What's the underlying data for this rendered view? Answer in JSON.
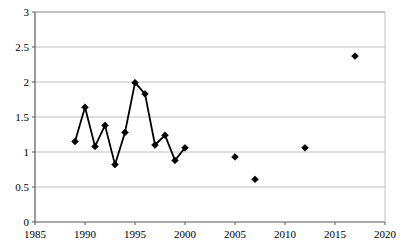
{
  "chart_data": {
    "type": "line",
    "title": "",
    "subtitle": "",
    "xlabel": "",
    "ylabel": "",
    "xlim": [
      1985,
      2020
    ],
    "ylim": [
      0,
      3
    ],
    "xticks": [
      1985,
      1990,
      1995,
      2000,
      2005,
      2010,
      2015,
      2020
    ],
    "xtick_labels": [
      "1985",
      "1990",
      "1995",
      "2000",
      "2005",
      "2010",
      "2015",
      "2020"
    ],
    "yticks": [
      0,
      0.5,
      1,
      1.5,
      2,
      2.5,
      3
    ],
    "ytick_labels": [
      "0",
      "0.5",
      "1",
      "1.5",
      "2",
      "2.5",
      "3"
    ],
    "grid": "horizontal",
    "legend": "none",
    "marker": "diamond",
    "marker_color": "#000000",
    "line_color": "#000000",
    "series": [
      {
        "name": "connected-series",
        "connected": true,
        "x": [
          1989,
          1990,
          1991,
          1992,
          1993,
          1994,
          1995,
          1996,
          1997,
          1998,
          1999,
          2000
        ],
        "values": [
          1.15,
          1.64,
          1.08,
          1.38,
          0.82,
          1.28,
          1.99,
          1.83,
          1.1,
          1.24,
          0.88,
          1.06
        ]
      },
      {
        "name": "isolated-points",
        "connected": false,
        "x": [
          2005,
          2007,
          2012,
          2017
        ],
        "values": [
          0.93,
          0.61,
          1.06,
          2.37
        ]
      }
    ]
  },
  "axes": {
    "axis_color": "#7f7f7f",
    "grid_color": "#c0c0c0",
    "plot_left": 35,
    "plot_right": 385,
    "plot_top": 12,
    "plot_bottom": 222
  }
}
